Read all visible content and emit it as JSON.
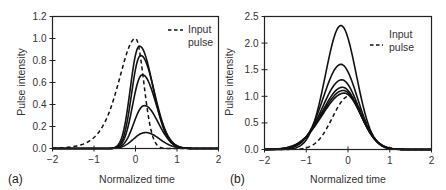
{
  "chart_data": [
    {
      "panel": "(a)",
      "type": "line",
      "xlabel": "Normalized time",
      "ylabel": "Pulse intensity",
      "xlim": [
        -2,
        2
      ],
      "ylim": [
        0,
        1.2
      ],
      "xticks": [
        "-2",
        "-1",
        "0",
        "1",
        "2"
      ],
      "yticks": [
        "0.0",
        "0.2",
        "0.4",
        "0.6",
        "0.8",
        "1.0",
        "1.2"
      ],
      "grid": false,
      "legend": {
        "entries": [
          {
            "label_line1": "Input",
            "label_line2": "pulse",
            "style": "dashed"
          }
        ],
        "position": "upper right"
      },
      "series": [
        {
          "name": "Input pulse",
          "style": "dashed",
          "peak": 1.0,
          "center": 0.0,
          "left_width": 0.55,
          "right_width": 0.28
        },
        {
          "name": "Output 1",
          "style": "solid",
          "peak": 0.93,
          "center": 0.1,
          "left_width": 0.3,
          "right_width": 0.45
        },
        {
          "name": "Output 2",
          "style": "solid",
          "peak": 0.845,
          "center": 0.13,
          "left_width": 0.3,
          "right_width": 0.46
        },
        {
          "name": "Output 3",
          "style": "solid",
          "peak": 0.67,
          "center": 0.17,
          "left_width": 0.32,
          "right_width": 0.46
        },
        {
          "name": "Output 4",
          "style": "solid",
          "peak": 0.39,
          "center": 0.22,
          "left_width": 0.35,
          "right_width": 0.46
        },
        {
          "name": "Output 5",
          "style": "solid",
          "peak": 0.145,
          "center": 0.25,
          "left_width": 0.4,
          "right_width": 0.46
        }
      ]
    },
    {
      "panel": "(b)",
      "type": "line",
      "xlabel": "Normalized time",
      "ylabel": "Pulse intensity",
      "xlim": [
        -2,
        2
      ],
      "ylim": [
        0,
        2.5
      ],
      "xticks": [
        "-2",
        "-1",
        "0",
        "1",
        "2"
      ],
      "yticks": [
        "0.0",
        "0.5",
        "1.0",
        "1.5",
        "2.0",
        "2.5"
      ],
      "grid": false,
      "legend": {
        "entries": [
          {
            "label_line1": "Input",
            "label_line2": "pulse",
            "style": "dashed"
          }
        ],
        "position": "upper right"
      },
      "series": [
        {
          "name": "Input pulse",
          "style": "dashed",
          "peak": 1.0,
          "center": 0.02,
          "left_width": 0.55,
          "right_width": 0.5
        },
        {
          "name": "Output 1",
          "style": "solid",
          "peak": 2.33,
          "center": -0.17,
          "left_width": 0.52,
          "right_width": 0.52
        },
        {
          "name": "Output 2",
          "style": "solid",
          "peak": 1.6,
          "center": -0.17,
          "left_width": 0.6,
          "right_width": 0.56
        },
        {
          "name": "Output 3",
          "style": "solid",
          "peak": 1.31,
          "center": -0.15,
          "left_width": 0.65,
          "right_width": 0.57
        },
        {
          "name": "Output 4",
          "style": "solid",
          "peak": 1.17,
          "center": -0.13,
          "left_width": 0.69,
          "right_width": 0.57
        },
        {
          "name": "Output 5",
          "style": "solid",
          "peak": 1.11,
          "center": -0.11,
          "left_width": 0.72,
          "right_width": 0.57
        },
        {
          "name": "Output 6",
          "style": "solid",
          "peak": 1.06,
          "center": -0.09,
          "left_width": 0.75,
          "right_width": 0.57
        }
      ]
    }
  ],
  "panels": [
    {
      "label": "(a)",
      "xlabel": "Normalized time",
      "ylabel": "Pulse intensity",
      "legend_line1": "Input",
      "legend_line2": "pulse"
    },
    {
      "label": "(b)",
      "xlabel": "Normalized time",
      "ylabel": "Pulse intensity",
      "legend_line1": "Input",
      "legend_line2": "pulse"
    }
  ],
  "colors": {
    "line": "#111111",
    "axis": "#222222",
    "background": "#ffffff"
  }
}
